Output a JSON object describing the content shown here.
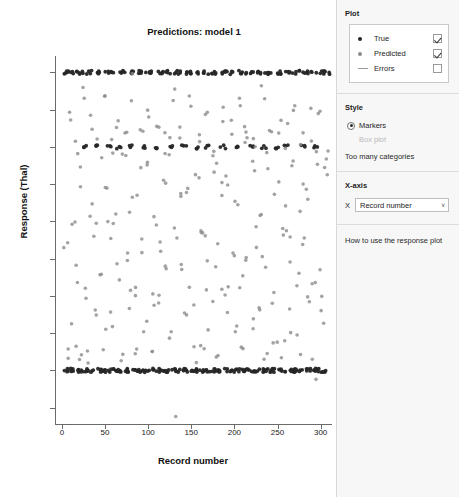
{
  "plot": {
    "title": "Predictions: model 1",
    "xlabel": "Record number",
    "ylabel": "Response (Thal)"
  },
  "sidebar": {
    "plot_section": {
      "heading": "Plot",
      "legend": [
        {
          "label": "True",
          "symbol": "filled-dot-dark",
          "checked": true
        },
        {
          "label": "Predicted",
          "symbol": "filled-dot-gray",
          "checked": true
        },
        {
          "label": "Errors",
          "symbol": "horizontal-line",
          "checked": false
        }
      ]
    },
    "style_section": {
      "heading": "Style",
      "options": [
        {
          "label": "Markers",
          "selected": true,
          "disabled": false
        },
        {
          "label": "Box plot",
          "selected": false,
          "disabled": true
        }
      ],
      "note": "Too many categories"
    },
    "xaxis_section": {
      "heading": "X-axis",
      "field_key": "X",
      "value": "Record number",
      "arrow": "∨"
    },
    "help_section": {
      "link": "How to use the response plot"
    }
  },
  "chart_data": {
    "type": "scatter",
    "title": "Predictions: model 1",
    "xlabel": "Record number",
    "ylabel": "Response (Thal)",
    "xlim": [
      -8,
      312
    ],
    "ylim": [
      2.28,
      7.22
    ],
    "xticks": [
      0,
      50,
      100,
      150,
      200,
      250,
      300
    ],
    "yticks": [
      2.5,
      3,
      3.5,
      4,
      4.5,
      5,
      5.5,
      6,
      6.5,
      7
    ],
    "grid": false,
    "legend_position": "outside-right",
    "colors": {
      "true": "#262626",
      "predicted": "#8c8c8c",
      "errors": "#9a9a9a"
    },
    "series": [
      {
        "name": "True",
        "marker": "circle",
        "color": "#262626",
        "note": "Categorical response taking only values 3, 6 and 7",
        "x": [
          2,
          5,
          8,
          9,
          12,
          14,
          16,
          19,
          21,
          24,
          26,
          27,
          30,
          33,
          35,
          37,
          39,
          42,
          44,
          46,
          48,
          51,
          53,
          55,
          58,
          60,
          62,
          64,
          67,
          69,
          71,
          73,
          76,
          78,
          80,
          83,
          85,
          87,
          90,
          92,
          94,
          96,
          99,
          101,
          103,
          106,
          108,
          110,
          113,
          115,
          117,
          119,
          122,
          124,
          126,
          129,
          131,
          133,
          136,
          138,
          140,
          142,
          145,
          147,
          149,
          152,
          154,
          156,
          159,
          161,
          163,
          165,
          168,
          170,
          172,
          175,
          177,
          179,
          182,
          184,
          186,
          188,
          191,
          193,
          195,
          198,
          200,
          202,
          205,
          207,
          209,
          211,
          214,
          216,
          218,
          221,
          223,
          225,
          228,
          230,
          232,
          234,
          237,
          239,
          241,
          244,
          246,
          248,
          251,
          253,
          255,
          257,
          260,
          262,
          264,
          267,
          269,
          271,
          274,
          276,
          278,
          280,
          283,
          285,
          287,
          290,
          292,
          294,
          297,
          299,
          301,
          303,
          306
        ],
        "y": [
          7,
          3,
          7,
          3,
          3,
          7,
          7,
          3,
          3,
          6,
          7,
          3,
          3,
          7,
          3,
          6,
          7,
          3,
          7,
          3,
          3,
          7,
          6,
          3,
          7,
          3,
          3,
          6,
          7,
          3,
          7,
          3,
          3,
          7,
          6,
          3,
          7,
          3,
          7,
          3,
          3,
          6,
          7,
          3,
          7,
          3,
          6,
          3,
          7,
          3,
          7,
          3,
          3,
          7,
          6,
          3,
          7,
          3,
          7,
          3,
          6,
          3,
          7,
          3,
          7,
          3,
          3,
          6,
          7,
          3,
          7,
          3,
          6,
          3,
          7,
          3,
          7,
          3,
          3,
          7,
          6,
          3,
          7,
          3,
          7,
          3,
          6,
          3,
          7,
          3,
          7,
          3,
          3,
          7,
          6,
          3,
          7,
          3,
          7,
          3,
          6,
          3,
          7,
          3,
          7,
          3,
          3,
          6,
          7,
          3,
          7,
          3,
          6,
          3,
          7,
          3,
          7,
          3,
          3,
          7,
          6,
          3,
          7,
          3,
          7,
          3,
          6,
          3,
          7,
          3,
          7,
          3,
          7
        ]
      },
      {
        "name": "Predicted",
        "marker": "circle",
        "color": "#8c8c8c",
        "note": "Continuous predictions spread mainly between 3 and 7",
        "x": [
          3,
          6,
          9,
          11,
          13,
          16,
          18,
          20,
          23,
          25,
          28,
          30,
          32,
          35,
          37,
          40,
          42,
          44,
          47,
          49,
          51,
          54,
          56,
          58,
          61,
          63,
          65,
          68,
          70,
          72,
          75,
          77,
          79,
          82,
          84,
          86,
          89,
          91,
          93,
          96,
          98,
          100,
          103,
          105,
          107,
          110,
          112,
          114,
          117,
          119,
          121,
          124,
          126,
          128,
          131,
          133,
          135,
          138,
          140,
          142,
          145,
          147,
          149,
          152,
          155,
          157,
          159,
          162,
          164,
          166,
          169,
          171,
          173,
          176,
          178,
          180,
          183,
          185,
          187,
          190,
          192,
          194,
          197,
          199,
          201,
          204,
          206,
          208,
          211,
          213,
          215,
          218,
          220,
          222,
          225,
          227,
          229,
          232,
          234,
          236,
          239,
          241,
          243,
          246,
          248,
          250,
          253,
          255,
          257,
          260,
          262,
          264,
          267,
          269,
          271,
          274,
          276,
          278,
          281,
          283,
          285,
          288,
          290,
          292,
          295,
          297,
          299,
          302,
          304,
          306
        ],
        "y": [
          4.6,
          3.2,
          6.5,
          5.1,
          3.5,
          6.1,
          4.4,
          3.3,
          5.6,
          6.6,
          4.0,
          3.1,
          5.2,
          6.3,
          4.8,
          3.6,
          5.9,
          4.2,
          6.7,
          3.4,
          5.4,
          4.9,
          6.0,
          3.7,
          5.0,
          6.4,
          4.3,
          3.2,
          5.7,
          6.2,
          4.6,
          3.9,
          5.3,
          6.8,
          4.1,
          3.3,
          5.5,
          6.1,
          4.7,
          3.5,
          5.8,
          6.5,
          4.0,
          3.1,
          5.1,
          6.3,
          4.5,
          3.8,
          5.6,
          6.0,
          4.2,
          3.4,
          5.9,
          6.6,
          4.8,
          2.4,
          5.2,
          6.2,
          4.4,
          3.6,
          5.4,
          6.7,
          4.1,
          3.2,
          5.7,
          6.1,
          4.9,
          3.5,
          5.0,
          6.4,
          4.3,
          3.7,
          5.8,
          6.0,
          4.6,
          3.3,
          5.3,
          6.5,
          4.0,
          3.9,
          5.5,
          6.2,
          4.7,
          3.4,
          5.1,
          6.6,
          4.2,
          3.1,
          5.9,
          6.3,
          4.5,
          3.6,
          5.6,
          6.1,
          4.8,
          3.8,
          5.2,
          6.7,
          4.4,
          3.2,
          5.7,
          6.0,
          4.1,
          3.5,
          5.4,
          6.4,
          4.9,
          3.3,
          5.0,
          6.2,
          4.6,
          3.7,
          5.8,
          6.5,
          4.3,
          3.4,
          5.3,
          6.1,
          4.7,
          3.9,
          5.5,
          6.3,
          4.0,
          3.1,
          5.9,
          6.6,
          4.2,
          3.6,
          5.6,
          6.0
        ]
      }
    ]
  }
}
